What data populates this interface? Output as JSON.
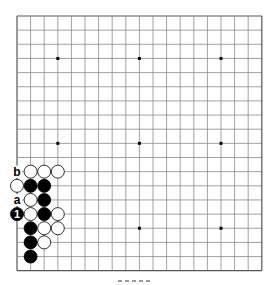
{
  "board": {
    "size": 19,
    "origin_x": 17,
    "origin_y": 16,
    "cell_w": 13.6,
    "cell_h": 14.15,
    "line_color": "#8a8a8a",
    "edge_color": "#555555",
    "star_points": [
      [
        3,
        3
      ],
      [
        9,
        3
      ],
      [
        15,
        3
      ],
      [
        3,
        9
      ],
      [
        9,
        9
      ],
      [
        15,
        9
      ],
      [
        3,
        15
      ],
      [
        9,
        15
      ],
      [
        15,
        15
      ]
    ]
  },
  "stones": [
    {
      "col": 1,
      "row": 11,
      "color": "white"
    },
    {
      "col": 2,
      "row": 11,
      "color": "white"
    },
    {
      "col": 3,
      "row": 11,
      "color": "white"
    },
    {
      "col": 0,
      "row": 12,
      "color": "white"
    },
    {
      "col": 1,
      "row": 12,
      "color": "black"
    },
    {
      "col": 2,
      "row": 12,
      "color": "black"
    },
    {
      "col": 1,
      "row": 13,
      "color": "white"
    },
    {
      "col": 2,
      "row": 13,
      "color": "black"
    },
    {
      "col": 0,
      "row": 14,
      "color": "black",
      "label": "1"
    },
    {
      "col": 1,
      "row": 14,
      "color": "white"
    },
    {
      "col": 2,
      "row": 14,
      "color": "black"
    },
    {
      "col": 3,
      "row": 14,
      "color": "white"
    },
    {
      "col": 1,
      "row": 15,
      "color": "black"
    },
    {
      "col": 2,
      "row": 15,
      "color": "white"
    },
    {
      "col": 3,
      "row": 15,
      "color": "white"
    },
    {
      "col": 1,
      "row": 16,
      "color": "black"
    },
    {
      "col": 2,
      "row": 16,
      "color": "white"
    },
    {
      "col": 1,
      "row": 17,
      "color": "black"
    }
  ],
  "point_labels": [
    {
      "col": 0,
      "row": 11,
      "text": "b"
    },
    {
      "col": 0,
      "row": 13,
      "text": "a"
    }
  ],
  "colors": {
    "black_stone": "#000000",
    "white_stone": "#ffffff",
    "stone_outline": "#000000",
    "label_text": "#000000"
  }
}
